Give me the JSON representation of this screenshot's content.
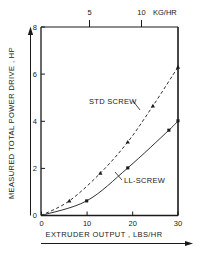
{
  "chart_data": {
    "type": "line",
    "title": "",
    "xlabel": "EXTRUDER OUTPUT , LBS/HR",
    "ylabel": "MEASURED TOTAL POWER DRIVE , HP",
    "xlim": [
      0,
      30
    ],
    "ylim": [
      0,
      8
    ],
    "grid": false,
    "legend_position": "inline-annotation",
    "x_ticks": [
      0,
      10,
      20,
      30
    ],
    "x_tick_labels": [
      "0",
      "10",
      "20",
      "30"
    ],
    "y_ticks": [
      0,
      2,
      4,
      6,
      8
    ],
    "y_tick_labels": [
      "0",
      "2",
      "4",
      "6",
      "8"
    ],
    "secondary_axis": {
      "position": "top",
      "label": "KG/HR",
      "ticks": [
        5,
        10
      ],
      "tick_labels": [
        "5",
        "10"
      ],
      "lim": [
        0,
        13.6
      ]
    },
    "series": [
      {
        "name": "STD SCREW",
        "linestyle": "dashed",
        "marker": "triangle",
        "color": "#1a1a1a",
        "points": [
          {
            "x": 0.0,
            "y": 0.0
          },
          {
            "x": 6.2,
            "y": 0.62
          },
          {
            "x": 13.0,
            "y": 1.8
          },
          {
            "x": 19.0,
            "y": 3.12
          },
          {
            "x": 24.5,
            "y": 4.65
          },
          {
            "x": 30.0,
            "y": 6.3
          }
        ]
      },
      {
        "name": "LL-SCREW",
        "linestyle": "solid",
        "marker": "square",
        "color": "#1a1a1a",
        "points": [
          {
            "x": 0.0,
            "y": 0.0
          },
          {
            "x": 10.0,
            "y": 0.62
          },
          {
            "x": 19.0,
            "y": 2.02
          },
          {
            "x": 28.0,
            "y": 3.62
          },
          {
            "x": 30.0,
            "y": 4.02
          }
        ]
      }
    ],
    "annotations": [
      {
        "text": "STD SCREW",
        "x_px": 89,
        "y_px": 101,
        "leader_to_x_px": 131,
        "leader_to_y_px": 112
      },
      {
        "text": "LL-SCREW",
        "x_px": 122,
        "y_px": 180,
        "leader_to_x_px": 117,
        "leader_to_y_px": 172
      }
    ]
  },
  "axes": {
    "y_title": "MEASURED TOTAL POWER DRIVE , HP",
    "x_title": "EXTRUDER OUTPUT , LBS/HR",
    "top_unit": "KG/HR"
  },
  "colors": {
    "ink": "#1a1a1a",
    "background": "#ffffff"
  }
}
